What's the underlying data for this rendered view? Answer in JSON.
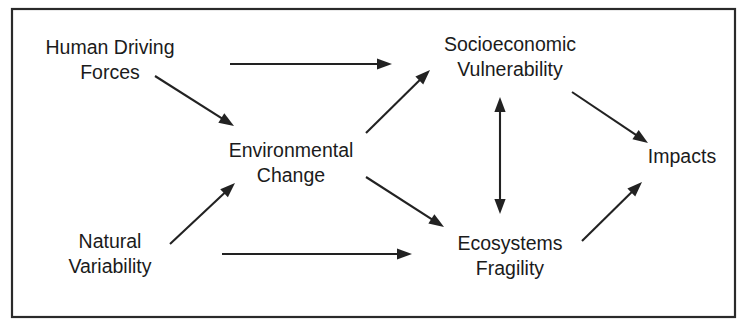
{
  "diagram": {
    "frame": {
      "x": 12,
      "y": 9,
      "width": 723,
      "height": 308,
      "stroke": "#2a2a2a"
    },
    "colors": {
      "text": "#1b1b1b",
      "line": "#222222",
      "background": "#ffffff"
    },
    "nodes": [
      {
        "id": "human-driving-forces",
        "lines": [
          "Human Driving",
          "Forces"
        ],
        "x": 110,
        "y": 54,
        "line_height": 25
      },
      {
        "id": "environmental-change",
        "lines": [
          "Environmental",
          "Change"
        ],
        "x": 291,
        "y": 157,
        "line_height": 25
      },
      {
        "id": "natural-variability",
        "lines": [
          "Natural",
          "Variability"
        ],
        "x": 110,
        "y": 248,
        "line_height": 25
      },
      {
        "id": "socioeconomic-vulnerability",
        "lines": [
          "Socioeconomic",
          "Vulnerability"
        ],
        "x": 510,
        "y": 51,
        "line_height": 25
      },
      {
        "id": "ecosystems-fragility",
        "lines": [
          "Ecosystems",
          "Fragility"
        ],
        "x": 510,
        "y": 250,
        "line_height": 25
      },
      {
        "id": "impacts",
        "lines": [
          "Impacts"
        ],
        "x": 682,
        "y": 163,
        "line_height": 25
      }
    ],
    "edges": [
      {
        "id": "human-driving-forces-to-socioeconomic-vulnerability",
        "from": "human-driving-forces",
        "to": "socioeconomic-vulnerability",
        "label": "Human Driving Forces to Socioeconomic Vulnerability",
        "x1": 230,
        "y1": 64,
        "x2": 392,
        "y2": 64,
        "arrowheads": "end"
      },
      {
        "id": "human-driving-forces-to-environmental-change",
        "from": "human-driving-forces",
        "to": "environmental-change",
        "label": "Human Driving Forces to Environmental Change",
        "x1": 155,
        "y1": 76,
        "x2": 234,
        "y2": 126,
        "arrowheads": "end"
      },
      {
        "id": "environmental-change-to-socioeconomic-vulnerability",
        "from": "environmental-change",
        "to": "socioeconomic-vulnerability",
        "label": "Environmental Change to Socioeconomic Vulnerability",
        "x1": 366,
        "y1": 133,
        "x2": 430,
        "y2": 70,
        "arrowheads": "end"
      },
      {
        "id": "environmental-change-to-ecosystems-fragility",
        "from": "environmental-change",
        "to": "ecosystems-fragility",
        "label": "Environmental Change to Ecosystems Fragility",
        "x1": 366,
        "y1": 177,
        "x2": 444,
        "y2": 227,
        "arrowheads": "end"
      },
      {
        "id": "natural-variability-to-environmental-change",
        "from": "natural-variability",
        "to": "environmental-change",
        "label": "Natural Variability to Environmental Change",
        "x1": 170,
        "y1": 244,
        "x2": 235,
        "y2": 183,
        "arrowheads": "end"
      },
      {
        "id": "natural-variability-to-ecosystems-fragility",
        "from": "natural-variability",
        "to": "ecosystems-fragility",
        "label": "Natural Variability to Ecosystems Fragility",
        "x1": 222,
        "y1": 254,
        "x2": 412,
        "y2": 254,
        "arrowheads": "end"
      },
      {
        "id": "socioeconomic-vulnerability-ecosystems-fragility-link",
        "from": "socioeconomic-vulnerability",
        "to": "ecosystems-fragility",
        "label": "Socioeconomic Vulnerability and Ecosystems Fragility bidirectional link",
        "x1": 500,
        "y1": 97,
        "x2": 500,
        "y2": 214,
        "arrowheads": "both"
      },
      {
        "id": "socioeconomic-vulnerability-to-impacts",
        "from": "socioeconomic-vulnerability",
        "to": "impacts",
        "label": "Socioeconomic Vulnerability to Impacts",
        "x1": 572,
        "y1": 92,
        "x2": 648,
        "y2": 143,
        "arrowheads": "end"
      },
      {
        "id": "ecosystems-fragility-to-impacts",
        "from": "ecosystems-fragility",
        "to": "impacts",
        "label": "Ecosystems Fragility to Impacts",
        "x1": 582,
        "y1": 241,
        "x2": 642,
        "y2": 182,
        "arrowheads": "end"
      }
    ]
  }
}
